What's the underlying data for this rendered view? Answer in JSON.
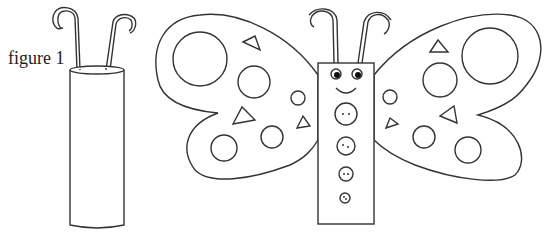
{
  "caption": "figure 1",
  "figure": {
    "left": "tube-with-pipe-cleaners",
    "right": "butterfly-craft",
    "butterfly_body_buttons": 4,
    "eyes": 2
  },
  "colors": {
    "line": "#333333",
    "background": "#ffffff"
  }
}
